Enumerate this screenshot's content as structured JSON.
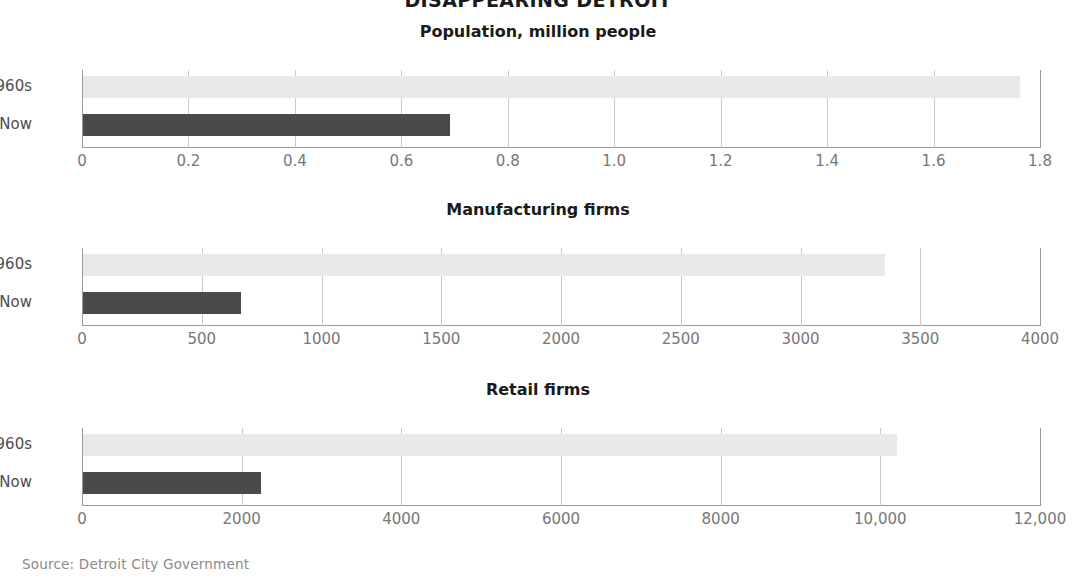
{
  "header": {
    "main_title": "DISAPPEARING DETROIT"
  },
  "footer": {
    "source": "Source: Detroit City Government"
  },
  "colors": {
    "bar_1960s": "#e9e9e9",
    "bar_now": "#4a4a4a",
    "axis": "#9a9a9a",
    "gridline": "#c9c9c9",
    "title_text": "#1a1a1a",
    "label_text": "#777777"
  },
  "chart_data": [
    {
      "type": "bar",
      "orientation": "horizontal",
      "title": "Population, million people",
      "categories": [
        "1960s",
        "Now"
      ],
      "values": [
        1.76,
        0.69
      ],
      "xlabel": "",
      "ylabel": "",
      "xlim": [
        0,
        1.8
      ],
      "xticks": [
        0,
        0.2,
        0.4,
        0.6,
        0.8,
        1.0,
        1.2,
        1.4,
        1.6,
        1.8
      ],
      "xticklabels": [
        "0",
        "0.2",
        "0.4",
        "0.6",
        "0.8",
        "1.0",
        "1.2",
        "1.4",
        "1.6",
        "1.8"
      ],
      "grid": true,
      "legend": "none"
    },
    {
      "type": "bar",
      "orientation": "horizontal",
      "title": "Manufacturing firms",
      "categories": [
        "1960s",
        "Now"
      ],
      "values": [
        3350,
        660
      ],
      "xlabel": "",
      "ylabel": "",
      "xlim": [
        0,
        4000
      ],
      "xticks": [
        0,
        500,
        1000,
        1500,
        2000,
        2500,
        3000,
        3500,
        4000
      ],
      "xticklabels": [
        "0",
        "500",
        "1000",
        "1500",
        "2000",
        "2500",
        "3000",
        "3500",
        "4000"
      ],
      "grid": true,
      "legend": "none"
    },
    {
      "type": "bar",
      "orientation": "horizontal",
      "title": "Retail firms",
      "categories": [
        "1960s",
        "Now"
      ],
      "values": [
        10200,
        2230
      ],
      "xlabel": "",
      "ylabel": "",
      "xlim": [
        0,
        12000
      ],
      "xticks": [
        0,
        2000,
        4000,
        6000,
        8000,
        10000,
        12000
      ],
      "xticklabels": [
        "0",
        "2000",
        "4000",
        "6000",
        "8000",
        "10,000",
        "12,000"
      ],
      "grid": true,
      "legend": "none"
    }
  ]
}
